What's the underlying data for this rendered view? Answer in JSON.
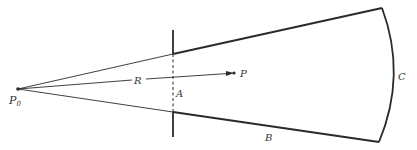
{
  "diagram": {
    "type": "cone-aperture-geometry",
    "colors": {
      "stroke": "#2a2a2a",
      "label": "#333333",
      "background": "#ffffff"
    },
    "points": {
      "P0": {
        "label": "P",
        "subscript": "0",
        "x": 18,
        "y": 89
      },
      "P": {
        "label": "P",
        "x": 234,
        "y": 73
      }
    },
    "labels": {
      "R": "R",
      "A": "A",
      "B": "B",
      "C": "C"
    },
    "aperture_line": {
      "x": 173,
      "y_top": 30,
      "y_bottom": 137
    },
    "cone": {
      "apex": [
        18,
        89
      ],
      "upper_at_aperture": [
        173,
        54
      ],
      "lower_at_aperture": [
        173,
        112
      ],
      "top_right": [
        382,
        8
      ],
      "bottom_right": [
        379,
        142
      ],
      "arc_bulge": [
        394,
        75
      ]
    }
  }
}
